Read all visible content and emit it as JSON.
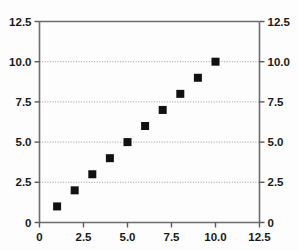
{
  "chart_data": {
    "type": "scatter",
    "title": "",
    "subtitle": "",
    "xlabel": "",
    "ylabel": "",
    "y2label": "",
    "xlim": [
      0,
      12.5
    ],
    "ylim": [
      0,
      12.5
    ],
    "grid": true,
    "grid_axis": "y",
    "legend": false,
    "legend_position": "none",
    "marker": "square",
    "marker_color": "#111111",
    "marker_size": 8,
    "dual_y_axis": true,
    "x": [
      1,
      2,
      3,
      4,
      5,
      6,
      7,
      8,
      9,
      10
    ],
    "y": [
      1,
      2,
      3,
      4,
      5,
      6,
      7,
      8,
      9,
      10
    ],
    "points": [
      {
        "x": 1,
        "y": 1
      },
      {
        "x": 2,
        "y": 2
      },
      {
        "x": 3,
        "y": 3
      },
      {
        "x": 4,
        "y": 4
      },
      {
        "x": 5,
        "y": 5
      },
      {
        "x": 6,
        "y": 6
      },
      {
        "x": 7,
        "y": 7
      },
      {
        "x": 8,
        "y": 8
      },
      {
        "x": 9,
        "y": 9
      },
      {
        "x": 10,
        "y": 10
      }
    ],
    "series": [
      {
        "name": "",
        "x": [
          1,
          2,
          3,
          4,
          5,
          6,
          7,
          8,
          9,
          10
        ],
        "values": [
          1,
          2,
          3,
          4,
          5,
          6,
          7,
          8,
          9,
          10
        ]
      }
    ],
    "xticks": [
      0,
      2.5,
      5.0,
      7.5,
      10.0,
      12.5
    ],
    "xtick_labels": [
      "0",
      "2.5",
      "5.0",
      "7.5",
      "10.0",
      "12.5"
    ],
    "yticks": [
      0,
      2.5,
      5.0,
      7.5,
      10.0,
      12.5
    ],
    "ytick_labels": [
      "0",
      "2.5",
      "5.0",
      "7.5",
      "10.0",
      "12.5"
    ],
    "y2ticks": [
      0,
      2.5,
      5.0,
      7.5,
      10.0,
      12.5
    ],
    "y2tick_labels": [
      "0",
      "2.5",
      "5.0",
      "7.5",
      "10.0",
      "12.5"
    ],
    "annotations": []
  },
  "axes": {
    "left": {
      "labels": [
        "12.5",
        "10.0",
        "7.5",
        "5.0",
        "2.5",
        "0"
      ]
    },
    "right": {
      "labels": [
        "12.5",
        "10.0",
        "7.5",
        "5.0",
        "2.5",
        "0"
      ]
    },
    "bottom": {
      "labels": [
        "0",
        "2.5",
        "5.0",
        "7.5",
        "10.0",
        "12.5"
      ]
    }
  },
  "colors": {
    "marker": "#111111",
    "axis": "#6e6e6e",
    "grid": "#9a9a9a",
    "background": "#fdfdfd",
    "text": "#1a1a1a"
  }
}
